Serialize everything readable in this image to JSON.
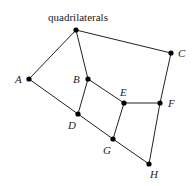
{
  "diagram": {
    "title": "quadrilaterals",
    "nodes": [
      {
        "id": "Q",
        "label": "",
        "x": 76,
        "y": 30
      },
      {
        "id": "A",
        "label": "A",
        "x": 29,
        "y": 79
      },
      {
        "id": "C",
        "label": "C",
        "x": 171,
        "y": 53
      },
      {
        "id": "B",
        "label": "B",
        "x": 88,
        "y": 79
      },
      {
        "id": "E",
        "label": "E",
        "x": 124,
        "y": 103
      },
      {
        "id": "F",
        "label": "F",
        "x": 160,
        "y": 103
      },
      {
        "id": "D",
        "label": "D",
        "x": 78,
        "y": 114
      },
      {
        "id": "G",
        "label": "G",
        "x": 113,
        "y": 139
      },
      {
        "id": "H",
        "label": "H",
        "x": 149,
        "y": 164
      }
    ],
    "edges": [
      [
        "Q",
        "A"
      ],
      [
        "Q",
        "B"
      ],
      [
        "Q",
        "C"
      ],
      [
        "A",
        "D"
      ],
      [
        "B",
        "D"
      ],
      [
        "B",
        "E"
      ],
      [
        "C",
        "F"
      ],
      [
        "E",
        "F"
      ],
      [
        "E",
        "G"
      ],
      [
        "D",
        "G"
      ],
      [
        "G",
        "H"
      ],
      [
        "F",
        "H"
      ]
    ]
  }
}
